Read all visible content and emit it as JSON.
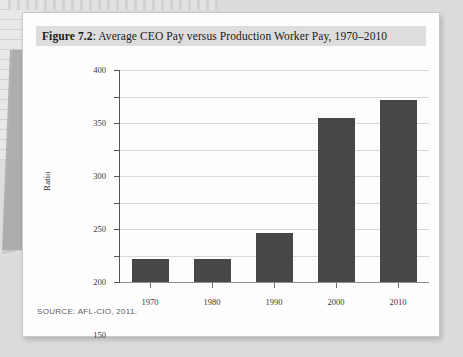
{
  "figure": {
    "label": "Figure 7.2",
    "separator": ":",
    "caption": "Average CEO Pay versus Production Worker Pay, 1970–2010",
    "source": "SOURCE: AFL-CIO, 2011."
  },
  "colors": {
    "bar": "#474747",
    "gridline": "#d7d7d7",
    "axis": "#545454",
    "title_band": "#dddddd",
    "card": "#fdfdfd"
  },
  "chart_data": {
    "type": "bar",
    "title": "Average CEO Pay versus Production Worker Pay, 1970–2010",
    "xlabel": "",
    "ylabel": "Ratio",
    "categories": [
      "1970",
      "1980",
      "1990",
      "2000",
      "2010"
    ],
    "values": [
      43,
      44,
      93,
      310,
      343
    ],
    "ylim": [
      0,
      400
    ],
    "yticks": [
      0,
      50,
      100,
      150,
      200,
      250,
      300,
      350,
      400
    ],
    "ytick_labels": [
      "0",
      "50",
      "100",
      "150",
      "200",
      "250",
      "300",
      "350",
      "400"
    ],
    "grid": "horizontal",
    "legend": "none",
    "series": [
      {
        "name": "Ratio of average CEO pay to production worker pay",
        "values": [
          43,
          44,
          93,
          310,
          343
        ]
      }
    ],
    "annotations": [
      "SOURCE: AFL-CIO, 2011."
    ]
  }
}
